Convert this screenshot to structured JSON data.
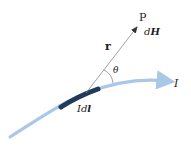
{
  "diagram": {
    "type": "biot-savart-current-element",
    "labels": {
      "point": "P",
      "field_prefix": "d",
      "field_vector": "H",
      "radius_vector": "r",
      "angle": "θ",
      "current": "I",
      "element_prefix": "Id",
      "element_vector": "l"
    },
    "colors": {
      "wire": "#a9c8e8",
      "element": "#1f3a5c",
      "radius_line": "#8a8a8a",
      "text": "#222222"
    }
  }
}
